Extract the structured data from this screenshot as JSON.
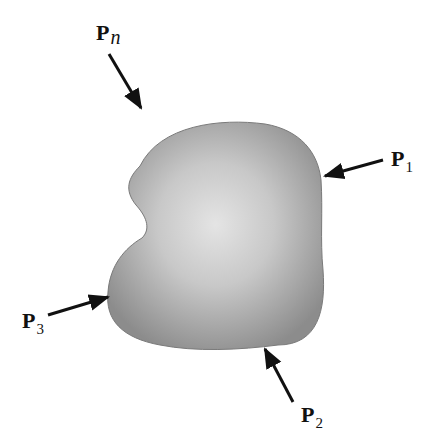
{
  "figure": {
    "body_fill": {
      "edge": "#8a8a8a",
      "center": "#e2e2e2"
    },
    "arrow_color": "#111111",
    "forces": [
      {
        "id": "pn",
        "symbol": "P",
        "subscript": "n"
      },
      {
        "id": "p1",
        "symbol": "P",
        "subscript": "1"
      },
      {
        "id": "p2",
        "symbol": "P",
        "subscript": "2"
      },
      {
        "id": "p3",
        "symbol": "P",
        "subscript": "3"
      }
    ]
  }
}
